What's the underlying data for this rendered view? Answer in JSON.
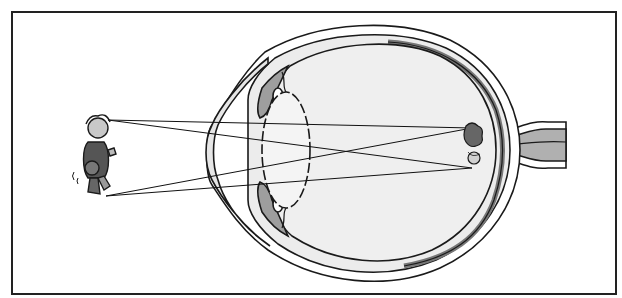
{
  "diagram": {
    "type": "eye-cross-section-image-inversion",
    "labels": [],
    "components": [
      {
        "name": "object-child-figure",
        "position": "left",
        "orientation": "upright"
      },
      {
        "name": "light-rays",
        "count": 4,
        "cross_point": "lens"
      },
      {
        "name": "cornea"
      },
      {
        "name": "iris"
      },
      {
        "name": "ciliary-body"
      },
      {
        "name": "lens"
      },
      {
        "name": "vitreous-body"
      },
      {
        "name": "sclera"
      },
      {
        "name": "choroid"
      },
      {
        "name": "retina"
      },
      {
        "name": "optic-nerve",
        "position": "right"
      },
      {
        "name": "retinal-image",
        "position": "back-of-eye",
        "orientation": "inverted"
      }
    ],
    "colors": {
      "stroke": "#1a1a1a",
      "light_fill": "#e9e9e9",
      "mid_fill": "#a8a8a8",
      "background": "#ffffff"
    }
  }
}
